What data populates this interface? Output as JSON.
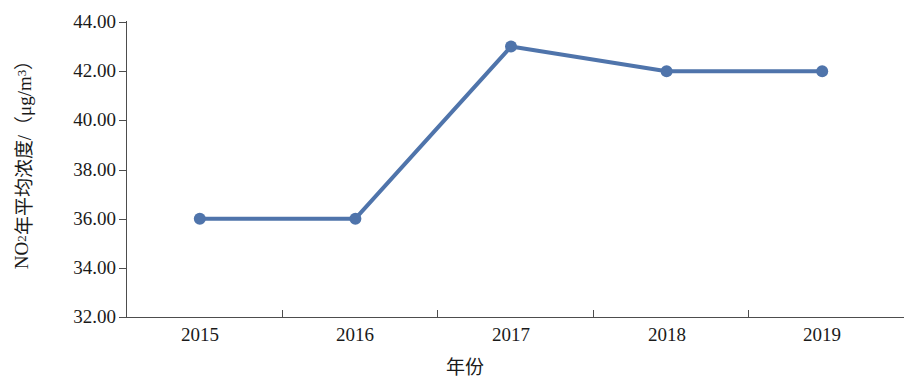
{
  "chart_data": {
    "type": "line",
    "title": "",
    "subtitle": "",
    "xlabel": "年份",
    "ylabel": "NO2年平均浓度/（μg/m3）",
    "ylabel_parts": {
      "prefix": "NO",
      "sub": "2",
      "middle": "年平均浓度/（μg/m",
      "sup": "3",
      "suffix": "）"
    },
    "categories": [
      "2015",
      "2016",
      "2017",
      "2018",
      "2019"
    ],
    "x_tick_labels": [
      "2015",
      "2016",
      "2017",
      "2018",
      "2019"
    ],
    "y_tick_labels": [
      "44.00",
      "42.00",
      "40.00",
      "38.00",
      "36.00",
      "34.00",
      "32.00"
    ],
    "y_tick_values": [
      44.0,
      42.0,
      40.0,
      38.0,
      36.0,
      34.0,
      32.0
    ],
    "ylim": [
      32.0,
      44.0
    ],
    "y_tick_step": 2.0,
    "grid": false,
    "legend": null,
    "legend_position": "none",
    "series": [
      {
        "name": "NO2年平均浓度",
        "values": [
          36.0,
          36.0,
          43.0,
          42.0,
          42.0
        ],
        "color": "#4f74ab",
        "marker": "circle",
        "marker_size": 9,
        "line_width": 4
      }
    ],
    "annotations": [],
    "axis_color": "#4d4d4d",
    "background_color": "#ffffff",
    "text_color": "#1a1a1a"
  }
}
